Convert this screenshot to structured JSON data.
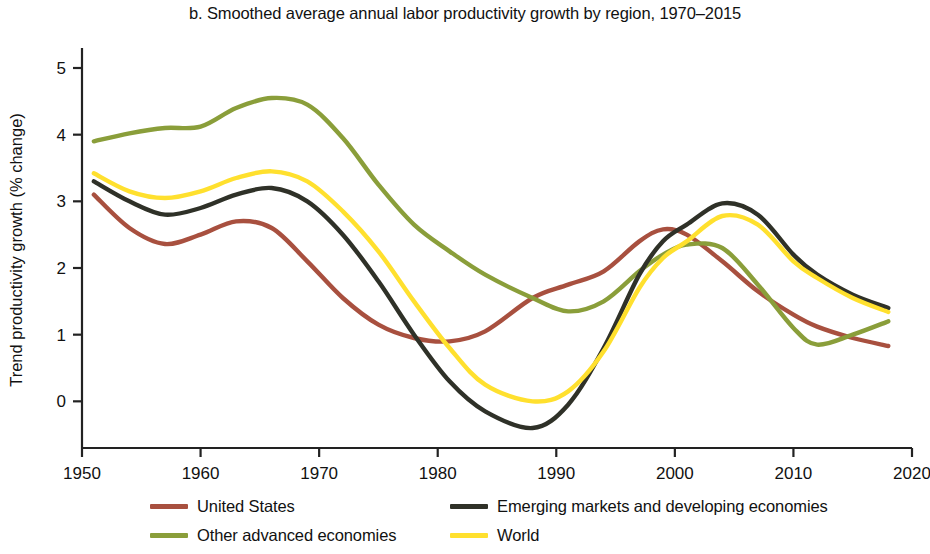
{
  "chart_data": {
    "type": "line",
    "title": "b. Smoothed average annual labor productivity growth by region, 1970–2015",
    "xlabel": "",
    "ylabel": "Trend productivity growth (% change)",
    "xlim": [
      1950,
      2020
    ],
    "ylim": [
      -0.7,
      5.3
    ],
    "xticks": [
      1950,
      1960,
      1970,
      1980,
      1990,
      2000,
      2010,
      2020
    ],
    "yticks": [
      0,
      1,
      2,
      3,
      4,
      5
    ],
    "xtick_labels": [
      "1950",
      "1960",
      "1970",
      "1980",
      "1990",
      "2000",
      "2010",
      "2020"
    ],
    "ytick_labels": [
      "0",
      "1",
      "2",
      "3",
      "4",
      "5"
    ],
    "grid": false,
    "legend_position": "below",
    "x": [
      1951,
      1954,
      1957,
      1960,
      1963,
      1966,
      1969,
      1972,
      1975,
      1978,
      1981,
      1984,
      1988,
      1991,
      1994,
      1997,
      1999,
      2001,
      2004,
      2007,
      2010,
      2012,
      2015,
      2018
    ],
    "series": [
      {
        "name": "United States",
        "color": "#a8503f",
        "values": [
          3.1,
          2.6,
          2.36,
          2.5,
          2.7,
          2.6,
          2.1,
          1.55,
          1.15,
          0.95,
          0.9,
          1.05,
          1.55,
          1.75,
          1.95,
          2.4,
          2.58,
          2.5,
          2.1,
          1.65,
          1.3,
          1.12,
          0.95,
          0.83
        ]
      },
      {
        "name": "Other advanced economies",
        "color": "#8a9e3a",
        "values": [
          3.9,
          4.02,
          4.1,
          4.12,
          4.4,
          4.55,
          4.45,
          3.95,
          3.25,
          2.65,
          2.25,
          1.9,
          1.55,
          1.35,
          1.5,
          1.95,
          2.2,
          2.35,
          2.3,
          1.75,
          1.1,
          0.85,
          1.0,
          1.2
        ]
      },
      {
        "name": "Emerging markets and developing economies",
        "color": "#2f3128",
        "values": [
          3.3,
          3.0,
          2.8,
          2.9,
          3.1,
          3.2,
          3.0,
          2.5,
          1.8,
          1.0,
          0.3,
          -0.15,
          -0.4,
          -0.05,
          0.8,
          1.9,
          2.4,
          2.65,
          2.97,
          2.8,
          2.2,
          1.9,
          1.6,
          1.4
        ]
      },
      {
        "name": "World",
        "color": "#ffe02e",
        "values": [
          3.42,
          3.15,
          3.05,
          3.15,
          3.35,
          3.45,
          3.3,
          2.85,
          2.25,
          1.5,
          0.8,
          0.25,
          0.0,
          0.15,
          0.75,
          1.7,
          2.15,
          2.4,
          2.78,
          2.65,
          2.1,
          1.85,
          1.55,
          1.34
        ]
      }
    ]
  },
  "legend": {
    "columns": [
      [
        {
          "label": "United States",
          "color": "#a8503f"
        },
        {
          "label": "Other advanced economies",
          "color": "#8a9e3a"
        }
      ],
      [
        {
          "label": "Emerging markets and developing economies",
          "color": "#2f3128"
        },
        {
          "label": "World",
          "color": "#ffe02e"
        }
      ]
    ]
  }
}
